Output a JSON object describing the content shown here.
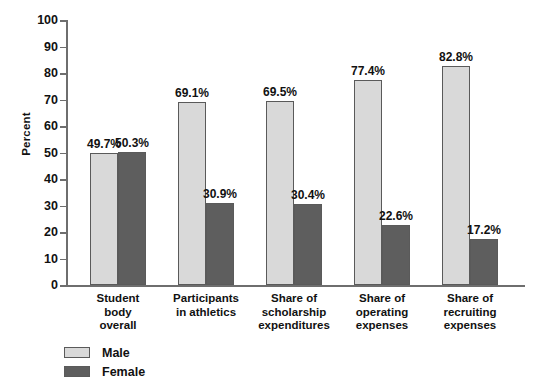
{
  "chart_data": {
    "type": "bar",
    "title": "",
    "xlabel": "",
    "ylabel": "Percent",
    "ylim": [
      0,
      100
    ],
    "ytick_step": 10,
    "yticks": [
      "100",
      "90",
      "80",
      "70",
      "60",
      "50",
      "40",
      "30",
      "20",
      "10",
      "0"
    ],
    "grid": false,
    "legend_position": "bottom-left",
    "categories": [
      "Student body overall",
      "Participants in athletics",
      "Share of scholarship expenditures",
      "Share of operating expenses",
      "Share of recruiting expenses"
    ],
    "category_lines": [
      [
        "Student",
        "body",
        "overall"
      ],
      [
        "Participants",
        "in athletics"
      ],
      [
        "Share of",
        "scholarship",
        "expenditures"
      ],
      [
        "Share of",
        "operating",
        "expenses"
      ],
      [
        "Share of",
        "recruiting",
        "expenses"
      ]
    ],
    "series": [
      {
        "name": "Male",
        "color": "#d9d9d9",
        "values": [
          49.7,
          69.1,
          69.5,
          77.4,
          82.8
        ],
        "labels": [
          "49.7%",
          "69.1%",
          "69.5%",
          "77.4%",
          "82.8%"
        ]
      },
      {
        "name": "Female",
        "color": "#5e5e5e",
        "values": [
          50.3,
          30.9,
          30.4,
          22.6,
          17.2
        ],
        "labels": [
          "50.3%",
          "30.9%",
          "30.4%",
          "22.6%",
          "17.2%"
        ]
      }
    ]
  },
  "legend": {
    "items": [
      {
        "label": "Male",
        "color": "#d9d9d9"
      },
      {
        "label": "Female",
        "color": "#5e5e5e"
      }
    ]
  },
  "axis": {
    "y_title": "Percent"
  }
}
